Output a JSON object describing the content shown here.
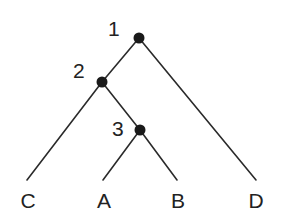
{
  "tree": {
    "leaves": [
      "C",
      "A",
      "B",
      "D"
    ],
    "nodes": [
      {
        "id": "node-1",
        "label": "1",
        "children": [
          "node-2",
          "D"
        ]
      },
      {
        "id": "node-2",
        "label": "2",
        "children": [
          "C",
          "node-3"
        ]
      },
      {
        "id": "node-3",
        "label": "3",
        "children": [
          "A",
          "B"
        ]
      }
    ],
    "colors": {
      "line": "#2a2a2a",
      "node": "#1a1a1a",
      "text": "#222222"
    }
  }
}
